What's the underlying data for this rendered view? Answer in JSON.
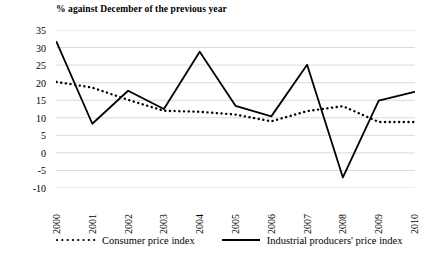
{
  "chart_data": {
    "type": "line",
    "title": "% against December of the previous year",
    "xlabel": "",
    "ylabel": "",
    "categories": [
      "2000",
      "2001",
      "2002",
      "2003",
      "2004",
      "2005",
      "2006",
      "2007",
      "2008",
      "2009",
      "2010"
    ],
    "x": [
      2000,
      2001,
      2002,
      2003,
      2004,
      2005,
      2006,
      2007,
      2008,
      2009,
      2010
    ],
    "series": [
      {
        "name": "Consumer price index",
        "style": "dotted",
        "color": "#000000",
        "values": [
          20.2,
          18.6,
          15.1,
          12.0,
          11.7,
          10.9,
          9.0,
          11.9,
          13.3,
          8.8,
          8.8
        ]
      },
      {
        "name": "Industrial producers' price index",
        "style": "solid",
        "color": "#000000",
        "values": [
          31.6,
          8.3,
          17.7,
          12.5,
          28.8,
          13.4,
          10.4,
          25.1,
          -7.0,
          14.9,
          17.4
        ]
      }
    ],
    "ylim": [
      -10,
      35
    ],
    "yticks": [
      "35",
      "30",
      "25",
      "20",
      "15",
      "10",
      "5",
      "0",
      "-5",
      "-10"
    ],
    "ytick_values": [
      35,
      30,
      25,
      20,
      15,
      10,
      5,
      0,
      -5,
      -10
    ],
    "grid": true,
    "grid_color": "#d9d9d9",
    "legend_position": "bottom",
    "background": "#ffffff"
  },
  "legend": {
    "entries": [
      {
        "label": "Consumer price index",
        "marker": "dotted-line-swatch"
      },
      {
        "label": "Industrial producers' price index",
        "marker": "solid-line-swatch"
      }
    ]
  }
}
